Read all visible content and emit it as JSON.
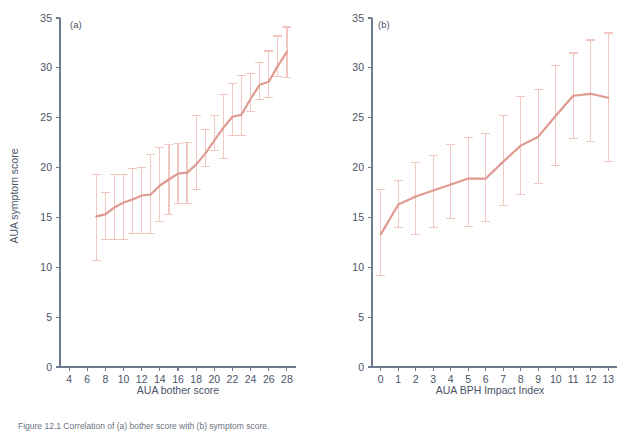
{
  "figure": {
    "caption": "Figure 12.1  Correlation of (a) bother score with (b) symptom score.",
    "panels": [
      {
        "tag": "(a)"
      },
      {
        "tag": "(b)"
      }
    ]
  },
  "chart_data": [
    {
      "type": "line",
      "panel": "(a)",
      "title": "",
      "xlabel": "AUA bother score",
      "ylabel": "AUA symptom score",
      "xlim": [
        3,
        29
      ],
      "ylim": [
        0,
        35
      ],
      "xticks": [
        4,
        6,
        8,
        10,
        12,
        14,
        16,
        18,
        20,
        22,
        24,
        26,
        28
      ],
      "yticks": [
        0,
        5,
        10,
        15,
        20,
        25,
        30,
        35
      ],
      "xticklabels": [
        "4",
        "6",
        "8",
        "10",
        "12",
        "14",
        "16",
        "18",
        "20",
        "22",
        "24",
        "26",
        "28"
      ],
      "yticklabels": [
        "0",
        "5",
        "10",
        "15",
        "20",
        "25",
        "30",
        "35"
      ],
      "grid": false,
      "legend": "none",
      "errorbars": true,
      "x": [
        7,
        8,
        9,
        10,
        11,
        12,
        13,
        14,
        15,
        16,
        17,
        18,
        19,
        20,
        21,
        22,
        23,
        24,
        25,
        26,
        27,
        28
      ],
      "values": [
        15.1,
        15.3,
        16.0,
        16.5,
        16.8,
        17.2,
        17.3,
        18.2,
        18.8,
        19.4,
        19.5,
        20.3,
        21.4,
        22.7,
        24.0,
        25.1,
        25.3,
        26.9,
        28.3,
        28.6,
        30.2,
        31.6
      ],
      "err_low": [
        10.7,
        12.8,
        12.8,
        12.8,
        13.4,
        13.4,
        13.4,
        14.6,
        15.3,
        16.4,
        16.4,
        17.8,
        20.1,
        21.7,
        20.9,
        23.2,
        23.2,
        25.6,
        26.8,
        27.0,
        29.1,
        29.0
      ],
      "err_high": [
        19.3,
        17.5,
        19.3,
        19.3,
        19.9,
        20.0,
        21.3,
        22.0,
        22.3,
        22.4,
        22.5,
        25.2,
        23.8,
        25.2,
        27.3,
        28.4,
        29.2,
        29.4,
        30.5,
        31.7,
        33.2,
        34.1
      ]
    },
    {
      "type": "line",
      "panel": "(b)",
      "title": "",
      "xlabel": "AUA BPH Impact Index",
      "ylabel": "AUA symptom score",
      "xlim": [
        -0.5,
        13.5
      ],
      "ylim": [
        0,
        35
      ],
      "xticks": [
        0,
        1,
        2,
        3,
        4,
        5,
        6,
        7,
        8,
        9,
        10,
        11,
        12,
        13
      ],
      "yticks": [
        0,
        5,
        10,
        15,
        20,
        25,
        30,
        35
      ],
      "xticklabels": [
        "0",
        "1",
        "2",
        "3",
        "4",
        "5",
        "6",
        "7",
        "8",
        "9",
        "10",
        "11",
        "12",
        "13"
      ],
      "yticklabels": [
        "0",
        "5",
        "10",
        "15",
        "20",
        "25",
        "30",
        "35"
      ],
      "grid": false,
      "legend": "none",
      "errorbars": true,
      "x": [
        0,
        1,
        2,
        3,
        4,
        5,
        6,
        7,
        8,
        9,
        10,
        11,
        12,
        13
      ],
      "values": [
        13.3,
        16.3,
        17.1,
        17.7,
        18.3,
        18.9,
        18.9,
        20.6,
        22.2,
        23.1,
        25.2,
        27.2,
        27.4,
        27.0
      ],
      "err_low": [
        9.2,
        14.0,
        13.3,
        14.0,
        14.9,
        14.1,
        14.6,
        16.2,
        17.3,
        18.4,
        20.2,
        22.9,
        22.6,
        20.6
      ],
      "err_high": [
        17.8,
        18.7,
        20.5,
        21.2,
        22.3,
        23.0,
        23.4,
        25.2,
        27.1,
        27.8,
        30.2,
        31.5,
        32.8,
        33.5
      ]
    }
  ]
}
